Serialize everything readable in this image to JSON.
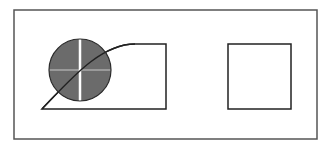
{
  "diagram": {
    "canvas": {
      "width": 332,
      "height": 149,
      "background": "#ffffff"
    },
    "frame": {
      "x": 14,
      "y": 10,
      "width": 303,
      "height": 129,
      "stroke": "#555555",
      "stroke_width": 1.5
    },
    "left_shape": {
      "description": "curved-top shape: curve rises from bottom-left to top edge, then straight top, right side and bottom",
      "path": "M 42 109 C 70 80, 100 44, 135 44 L 166 44 L 166 109 Z",
      "stroke": "#222222",
      "stroke_width": 1.5,
      "fill": "none"
    },
    "circle": {
      "cx": 80,
      "cy": 70,
      "r": 31,
      "fill": "#6b6b6b",
      "stroke": "#2a2a2a",
      "vertical_line_color": "#ffffff",
      "horizontal_line_color": "#9a9a9a"
    },
    "right_square": {
      "x": 228,
      "y": 44,
      "width": 63,
      "height": 65,
      "stroke": "#222222",
      "stroke_width": 1.5
    }
  }
}
